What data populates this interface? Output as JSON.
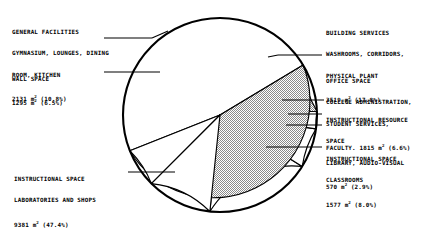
{
  "chart_data": {
    "type": "pie",
    "title": "",
    "unit": "m²",
    "total_label": "",
    "legend_position": "callout-labels",
    "categories": [
      "BUILDING SERVICES",
      "OFFICE SPACE",
      "INSTRUCTIONAL RESOURCE SPACE",
      "INSTRUCTIONAL SPACE CLASSROOMS",
      "INSTRUCTIONAL SPACE LABORATORIES AND SHOPS",
      "WALL SPACE",
      "GENERAL FACILITIES"
    ],
    "values": [
      3519,
      1815,
      570,
      1577,
      9381,
      1295,
      2131
    ],
    "percents": [
      17.8,
      6.6,
      2.9,
      8.0,
      47.4,
      6.5,
      10.8
    ],
    "fills": [
      "white",
      "white",
      "white",
      "shaded",
      "shaded",
      "white",
      "white"
    ],
    "slices": [
      {
        "key": "building_services",
        "percent": 17.8,
        "area": 3519,
        "fill": "white",
        "start_deg": -6,
        "end_deg": 58,
        "lines": [
          "BUILDING SERVICES",
          "WASHROOMS, CORRIDORS,",
          "PHYSICAL PLANT"
        ],
        "value_line": "3519 m² (17.8%)"
      },
      {
        "key": "office_space",
        "percent": 6.6,
        "area": 1815,
        "fill": "white",
        "start_deg": 58,
        "end_deg": 81.8,
        "lines": [
          "OFFICE SPACE",
          "COLLEGE ADMINISTRATION,",
          "STUDENT SERVICES,"
        ],
        "value_line": "FACULTY. 1815 m² (6.6%)"
      },
      {
        "key": "instructional_resource_space",
        "percent": 2.9,
        "area": 570,
        "fill": "white",
        "start_deg": 81.8,
        "end_deg": 92.2,
        "lines": [
          "INSTRUCTIONAL RESOURCE",
          "SPACE",
          "LIBRARY, AUDIO-VISUAL"
        ],
        "value_line": "570 m² (2.9%)"
      },
      {
        "key": "instructional_space_classrooms",
        "percent": 8.0,
        "area": 1577,
        "fill": "shaded",
        "start_deg": 92.2,
        "end_deg": 121,
        "lines": [
          "INSTRUCTIONAL SPACE",
          "CLASSROOMS"
        ],
        "value_line": "1577 m² (8.0%)"
      },
      {
        "key": "instructional_space_laboratories",
        "percent": 47.4,
        "area": 9381,
        "fill": "shaded",
        "start_deg": 121,
        "end_deg": 291.6,
        "lines": [
          "INSTRUCTIONAL SPACE",
          "LABORATORIES AND SHOPS"
        ],
        "value_line": "9381 m² (47.4%)"
      },
      {
        "key": "wall_space",
        "percent": 6.5,
        "area": 1295,
        "fill": "white",
        "start_deg": 291.6,
        "end_deg": 315,
        "lines": [
          "WALL SPACE"
        ],
        "value_line": "1295 m² (6.5%)"
      },
      {
        "key": "general_facilities",
        "percent": 10.8,
        "area": 2131,
        "fill": "white",
        "start_deg": 315,
        "end_deg": 354,
        "lines": [
          "GENERAL FACILITIES",
          "GYMNASIUM, LOUNGES, DINING",
          "ROOM, KITCHEN"
        ],
        "value_line": "2131 m² (10.8%)"
      }
    ],
    "xlabel": "",
    "ylabel": "",
    "grid": false
  },
  "labels": {
    "general_facilities": {
      "l1": "GENERAL FACILITIES",
      "l2": "GYMNASIUM, LOUNGES, DINING",
      "l3": "ROOM, KITCHEN",
      "l4_num": "2131 m",
      "l4_sup": "2",
      "l4_pct": " (10.8%)"
    },
    "wall_space": {
      "l1": "WALL SPACE",
      "l2_num": "1295 m",
      "l2_sup": "2",
      "l2_pct": " (6.5%)"
    },
    "instructional_labs": {
      "l1": "INSTRUCTIONAL SPACE",
      "l2": "LABORATORIES AND SHOPS",
      "l3_num": "9381 m",
      "l3_sup": "2",
      "l3_pct": " (47.4%)"
    },
    "building_services": {
      "l1": "BUILDING SERVICES",
      "l2": "WASHROOMS, CORRIDORS,",
      "l3": "PHYSICAL PLANT",
      "l4_num": "3519 m",
      "l4_sup": "2",
      "l4_pct": " (17.8%)"
    },
    "office_space": {
      "l1": "OFFICE SPACE",
      "l2": "COLLEGE ADMINISTRATION,",
      "l3": "STUDENT SERVICES,",
      "l4_num": "FACULTY. 1815 m",
      "l4_sup": "2",
      "l4_pct": " (6.6%)"
    },
    "instructional_resource": {
      "l1": "INSTRUCTIONAL RESOURCE",
      "l2": "SPACE",
      "l3": "LIBRARY, AUDIO-VISUAL",
      "l4_num": "570 m",
      "l4_sup": "2",
      "l4_pct": " (2.9%)"
    },
    "instructional_classrooms": {
      "l1": "INSTRUCTIONAL SPACE",
      "l2": "CLASSROOMS",
      "l3_num": "1577 m",
      "l3_sup": "2",
      "l3_pct": " (8.0%)"
    }
  },
  "colors": {
    "outline": "#000000",
    "slice_white": "#ffffff",
    "slice_shaded": "#b4b4b4",
    "text": "#000000",
    "background": "#ffffff"
  }
}
